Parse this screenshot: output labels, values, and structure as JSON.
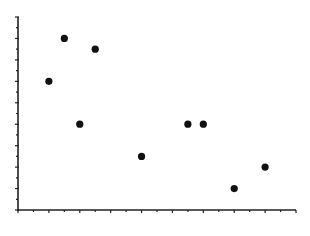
{
  "chart_data": {
    "type": "scatter",
    "title": "",
    "xlabel": "",
    "ylabel": "",
    "xlim": [
      0,
      18
    ],
    "ylim": [
      0,
      18
    ],
    "grid": false,
    "legend": null,
    "x_tick_count": 18,
    "y_tick_count": 18,
    "tick_labels_visible": false,
    "marker_color": "#111111",
    "axis_color": "#222222",
    "points": [
      {
        "x": 2,
        "y": 12
      },
      {
        "x": 3,
        "y": 16
      },
      {
        "x": 4,
        "y": 8
      },
      {
        "x": 5,
        "y": 15
      },
      {
        "x": 8,
        "y": 5
      },
      {
        "x": 11,
        "y": 8
      },
      {
        "x": 12,
        "y": 8
      },
      {
        "x": 14,
        "y": 2
      },
      {
        "x": 16,
        "y": 4
      }
    ]
  },
  "layout": {
    "origin_px": [
      18,
      210
    ],
    "x_end_px": 296,
    "y_top_px": 17
  }
}
